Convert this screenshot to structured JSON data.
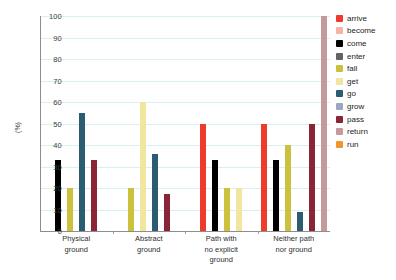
{
  "chart_data": {
    "type": "bar",
    "title": "",
    "xlabel": "",
    "ylabel": "(%)",
    "ylim": [
      0,
      100
    ],
    "ytick_step": 10,
    "yticks": [
      100,
      90,
      80,
      70,
      60,
      50,
      40,
      30,
      20,
      10,
      0
    ],
    "grid": true,
    "legend_position": "right",
    "categories": [
      "Physical\nground",
      "Abstract\nground",
      "Path with\nno explicit\nground",
      "Neither path\nnor ground"
    ],
    "category_lines": [
      [
        "Physical",
        "ground"
      ],
      [
        "Abstract",
        "ground"
      ],
      [
        "Path with",
        "no explicit",
        "ground"
      ],
      [
        "Neither path",
        "nor ground"
      ]
    ],
    "series": [
      {
        "name": "arrive",
        "color": "#ef3b2c",
        "values": [
          0,
          0,
          50,
          50
        ]
      },
      {
        "name": "become",
        "color": "#f9b3a4",
        "values": [
          0,
          0,
          0,
          0
        ]
      },
      {
        "name": "come",
        "color": "#000000",
        "values": [
          33,
          0,
          33,
          33
        ]
      },
      {
        "name": "enter",
        "color": "#636363",
        "values": [
          0,
          0,
          0,
          0
        ]
      },
      {
        "name": "fall",
        "color": "#ccc13c",
        "values": [
          20,
          20,
          20,
          40
        ]
      },
      {
        "name": "get",
        "color": "#f1e6a0",
        "values": [
          0,
          60,
          20,
          0
        ]
      },
      {
        "name": "go",
        "color": "#2b5c72",
        "values": [
          55,
          36,
          0,
          9
        ]
      },
      {
        "name": "grow",
        "color": "#9aa8c0",
        "values": [
          0,
          0,
          0,
          0
        ]
      },
      {
        "name": "pass",
        "color": "#8c2437",
        "values": [
          33,
          17,
          0,
          50
        ]
      },
      {
        "name": "return",
        "color": "#c49a9c",
        "values": [
          0,
          0,
          0,
          100
        ]
      },
      {
        "name": "run",
        "color": "#f0962e",
        "values": [
          0,
          0,
          0,
          0
        ]
      }
    ],
    "group_bars": [
      [
        {
          "name": "come",
          "value": 33,
          "color": "#000000"
        },
        {
          "name": "fall",
          "value": 20,
          "color": "#ccc13c"
        },
        {
          "name": "go",
          "value": 55,
          "color": "#2b5c72"
        },
        {
          "name": "pass",
          "value": 33,
          "color": "#8c2437"
        }
      ],
      [
        {
          "name": "fall",
          "value": 20,
          "color": "#ccc13c"
        },
        {
          "name": "get",
          "value": 60,
          "color": "#f1e6a0"
        },
        {
          "name": "go",
          "value": 36,
          "color": "#2b5c72"
        },
        {
          "name": "pass",
          "value": 17,
          "color": "#8c2437"
        }
      ],
      [
        {
          "name": "arrive",
          "value": 50,
          "color": "#ef3b2c"
        },
        {
          "name": "come",
          "value": 33,
          "color": "#000000"
        },
        {
          "name": "fall",
          "value": 20,
          "color": "#ccc13c"
        },
        {
          "name": "get",
          "value": 20,
          "color": "#f1e6a0"
        }
      ],
      [
        {
          "name": "arrive",
          "value": 50,
          "color": "#ef3b2c"
        },
        {
          "name": "come",
          "value": 33,
          "color": "#000000"
        },
        {
          "name": "fall",
          "value": 40,
          "color": "#ccc13c"
        },
        {
          "name": "go",
          "value": 9,
          "color": "#2b5c72"
        },
        {
          "name": "pass",
          "value": 50,
          "color": "#8c2437"
        },
        {
          "name": "return",
          "value": 100,
          "color": "#c49a9c"
        }
      ]
    ],
    "legend": [
      {
        "label": "arrive",
        "color": "#ef3b2c"
      },
      {
        "label": "become",
        "color": "#f9b3a4"
      },
      {
        "label": "come",
        "color": "#000000"
      },
      {
        "label": "enter",
        "color": "#636363"
      },
      {
        "label": "fall",
        "color": "#ccc13c"
      },
      {
        "label": "get",
        "color": "#f1e6a0"
      },
      {
        "label": "go",
        "color": "#2b5c72"
      },
      {
        "label": "grow",
        "color": "#9aa8c0"
      },
      {
        "label": "pass",
        "color": "#8c2437"
      },
      {
        "label": "return",
        "color": "#c49a9c"
      },
      {
        "label": "run",
        "color": "#f0962e"
      }
    ]
  }
}
